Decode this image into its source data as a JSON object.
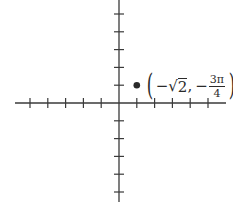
{
  "diagram": {
    "type": "cartesian-axes-with-point",
    "colors": {
      "axis": "#3a3a3a",
      "point": "#2a2a2a",
      "background": "#ffffff"
    },
    "axes": {
      "origin_px": [
        119,
        103
      ],
      "tick_spacing_px": 17.8,
      "x_ticks_left": 5,
      "x_ticks_right": 5,
      "y_ticks_up": 5,
      "y_ticks_down": 5
    },
    "point": {
      "plotted_at_grid": [
        1,
        1
      ],
      "label": {
        "open_paren": "(",
        "minus1": "−",
        "sqrt_sign": "√",
        "sqrt_arg": "2",
        "comma": ",",
        "minus2": "−",
        "frac_num": "3π",
        "frac_den": "4",
        "close_paren": ")"
      },
      "label_text": "(−√2, −3π/4)"
    }
  }
}
